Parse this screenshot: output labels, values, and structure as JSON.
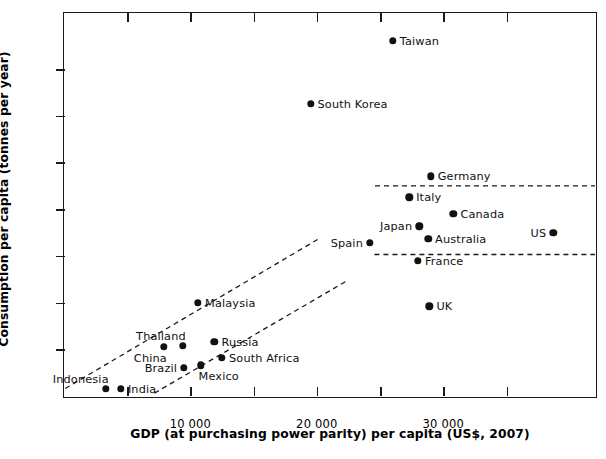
{
  "chart_data": {
    "type": "scatter",
    "title": "",
    "xlabel": "GDP (at purchasing power parity) per capita (US$, 2007)",
    "ylabel": "Consumption per capita (tonnes per year)",
    "xlim": [
      0,
      42000
    ],
    "ylim": [
      0,
      82
    ],
    "grid": false,
    "legend": "none",
    "x_ticks_major": [
      {
        "value": 10000,
        "label": "10 000"
      },
      {
        "value": 20000,
        "label": "20 000"
      },
      {
        "value": 30000,
        "label": "30 000"
      }
    ],
    "x_ticks_minor": [
      5000,
      15000,
      25000,
      35000
    ],
    "y_ticks_major": [
      {
        "value": 20,
        "label": "20"
      },
      {
        "value": 40,
        "label": "40"
      },
      {
        "value": 60,
        "label": "60"
      }
    ],
    "y_ticks_minor": [
      10,
      30,
      50,
      70
    ],
    "points": [
      {
        "label": "Taiwan",
        "x": 26000,
        "y": 76,
        "label_side": "right"
      },
      {
        "label": "South Korea",
        "x": 19500,
        "y": 62.5,
        "label_side": "right"
      },
      {
        "label": "Germany",
        "x": 29000,
        "y": 47,
        "label_side": "right"
      },
      {
        "label": "Italy",
        "x": 27300,
        "y": 42.5,
        "label_side": "right"
      },
      {
        "label": "Canada",
        "x": 30800,
        "y": 39,
        "label_side": "right"
      },
      {
        "label": "Japan",
        "x": 28100,
        "y": 36.3,
        "label_side": "left"
      },
      {
        "label": "US",
        "x": 38700,
        "y": 35,
        "label_side": "left"
      },
      {
        "label": "Australia",
        "x": 28800,
        "y": 33.6,
        "label_side": "right"
      },
      {
        "label": "Spain",
        "x": 24200,
        "y": 32.8,
        "label_side": "left"
      },
      {
        "label": "France",
        "x": 28000,
        "y": 29,
        "label_side": "right"
      },
      {
        "label": "UK",
        "x": 28900,
        "y": 19.2,
        "label_side": "right"
      },
      {
        "label": "Malaysia",
        "x": 10600,
        "y": 20,
        "label_side": "right"
      },
      {
        "label": "Russia",
        "x": 11900,
        "y": 11.6,
        "label_side": "right"
      },
      {
        "label": "Thailand",
        "x": 9400,
        "y": 10.8,
        "label_side": "above-left"
      },
      {
        "label": "China",
        "x": 7900,
        "y": 10.5,
        "label_side": "below-left"
      },
      {
        "label": "South Africa",
        "x": 12500,
        "y": 8.2,
        "label_side": "right"
      },
      {
        "label": "Mexico",
        "x": 10800,
        "y": 6.6,
        "label_side": "below-right"
      },
      {
        "label": "Brazil",
        "x": 9500,
        "y": 6.0,
        "label_side": "left"
      },
      {
        "label": "India",
        "x": 4500,
        "y": 1.5,
        "label_side": "right"
      },
      {
        "label": "Indonesia",
        "x": 3300,
        "y": 1.6,
        "label_side": "above-left"
      }
    ],
    "reference_lines": [
      {
        "name": "upper-horizontal-band",
        "type": "horizontal-dashed",
        "y": 45,
        "x_from": 24600,
        "x_to": 42000
      },
      {
        "name": "lower-horizontal-band",
        "type": "horizontal-dashed",
        "y": 30.3,
        "x_from": 24550,
        "x_to": 42000
      },
      {
        "name": "upper-diagonal-band",
        "type": "diagonal-dashed",
        "x_from": 100,
        "y_from": 1.6,
        "x_to": 20300,
        "y_to": 33.9
      },
      {
        "name": "lower-diagonal-band",
        "type": "diagonal-dashed",
        "x_from": 7150,
        "y_from": 0.6,
        "x_to": 22400,
        "y_to": 24.7
      }
    ]
  },
  "caption": {
    "text": ""
  }
}
